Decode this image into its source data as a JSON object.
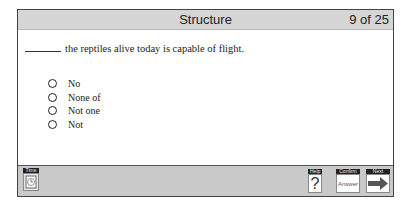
{
  "header": {
    "title": "Structure",
    "counter": "9 of 25"
  },
  "question": {
    "text": "the reptiles alive today is capable of flight."
  },
  "options": [
    {
      "label": "No",
      "selected": false
    },
    {
      "label": "None of",
      "selected": false
    },
    {
      "label": "Not one",
      "selected": false
    },
    {
      "label": "Not",
      "selected": false
    }
  ],
  "toolbar": {
    "time_label": "Time",
    "time_icon": "clock-icon",
    "help_label": "Help",
    "help_glyph": "?",
    "confirm_label": "Confirm",
    "confirm_face": "Answer",
    "next_label": "Next",
    "next_icon": "arrow-right-icon"
  }
}
